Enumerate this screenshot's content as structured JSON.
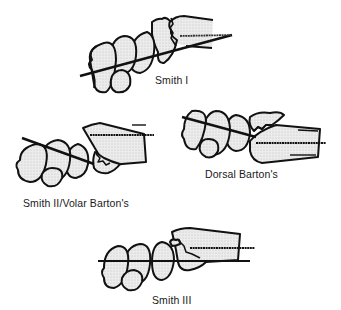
{
  "diagram": {
    "colors": {
      "outline": "#111111",
      "bone_fill": "#e6e6e6",
      "background": "#ffffff",
      "text": "#1a1a1a"
    },
    "panels": [
      {
        "id": "smith-1",
        "label": "Smith I"
      },
      {
        "id": "smith-2",
        "label": "Smith II/Volar Barton's"
      },
      {
        "id": "dorsal-barton",
        "label": "Dorsal Barton's"
      },
      {
        "id": "smith-3",
        "label": "Smith III"
      }
    ]
  }
}
